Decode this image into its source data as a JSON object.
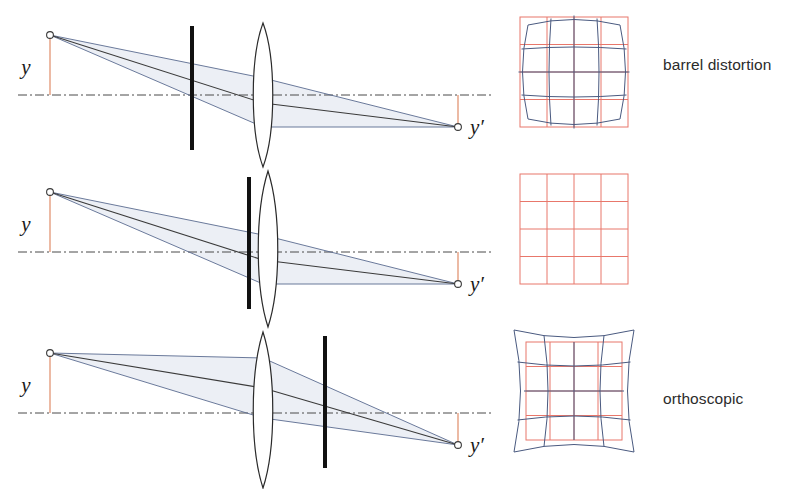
{
  "figure": {
    "background_color": "#ffffff",
    "width": 811,
    "height": 489
  },
  "colors": {
    "reference_grid": "#e8776b",
    "distorted_grid": "#4a5a80",
    "ray": "#5a6b90",
    "ray_fill": "#eceff5",
    "principal_ray": "#3a3a3a",
    "stop": "#111111",
    "lens_outline": "#2a2a2a",
    "axis": "#4a4a4a",
    "height_marker": "#e8a98e",
    "label_text": "#2b2b2b"
  },
  "labels": {
    "object_height": "y",
    "image_height": "y′"
  },
  "icons": {
    "object_point": "open-circle-marker",
    "image_point": "open-circle-marker",
    "lens": "biconvex-lens",
    "stop": "aperture-stop-bar",
    "axis": "optical-axis-dash-dot"
  },
  "rows": [
    {
      "id": "barrel",
      "caption": "barrel distortion",
      "stop_position": "before-lens",
      "stop_x": 192,
      "grid": {
        "type": "barrel",
        "reference_label": "undistorted square grid",
        "distorted_label": "barrel (bulging) grid",
        "divisions": 4
      }
    },
    {
      "id": "orthoscopic",
      "caption": "orthoscopic",
      "stop_position": "at-lens",
      "stop_x": 249,
      "grid": {
        "type": "orthoscopic",
        "reference_label": "undistorted square grid",
        "distorted_label": "none",
        "divisions": 4
      }
    },
    {
      "id": "pincushion",
      "caption": "pincushion\ndistortion",
      "stop_position": "after-lens",
      "stop_x": 325,
      "grid": {
        "type": "pincushion",
        "reference_label": "undistorted square grid",
        "distorted_label": "pincushion (pinched) grid",
        "divisions": 4
      }
    }
  ],
  "optics": {
    "object_point": {
      "x": 50,
      "y": 35
    },
    "image_point": {
      "x": 458,
      "y": 127
    },
    "axis_y": 95,
    "lens": {
      "x": 263,
      "half_height": 72,
      "half_width": 13
    },
    "axis_x_start": 18,
    "axis_x_end": 494
  }
}
